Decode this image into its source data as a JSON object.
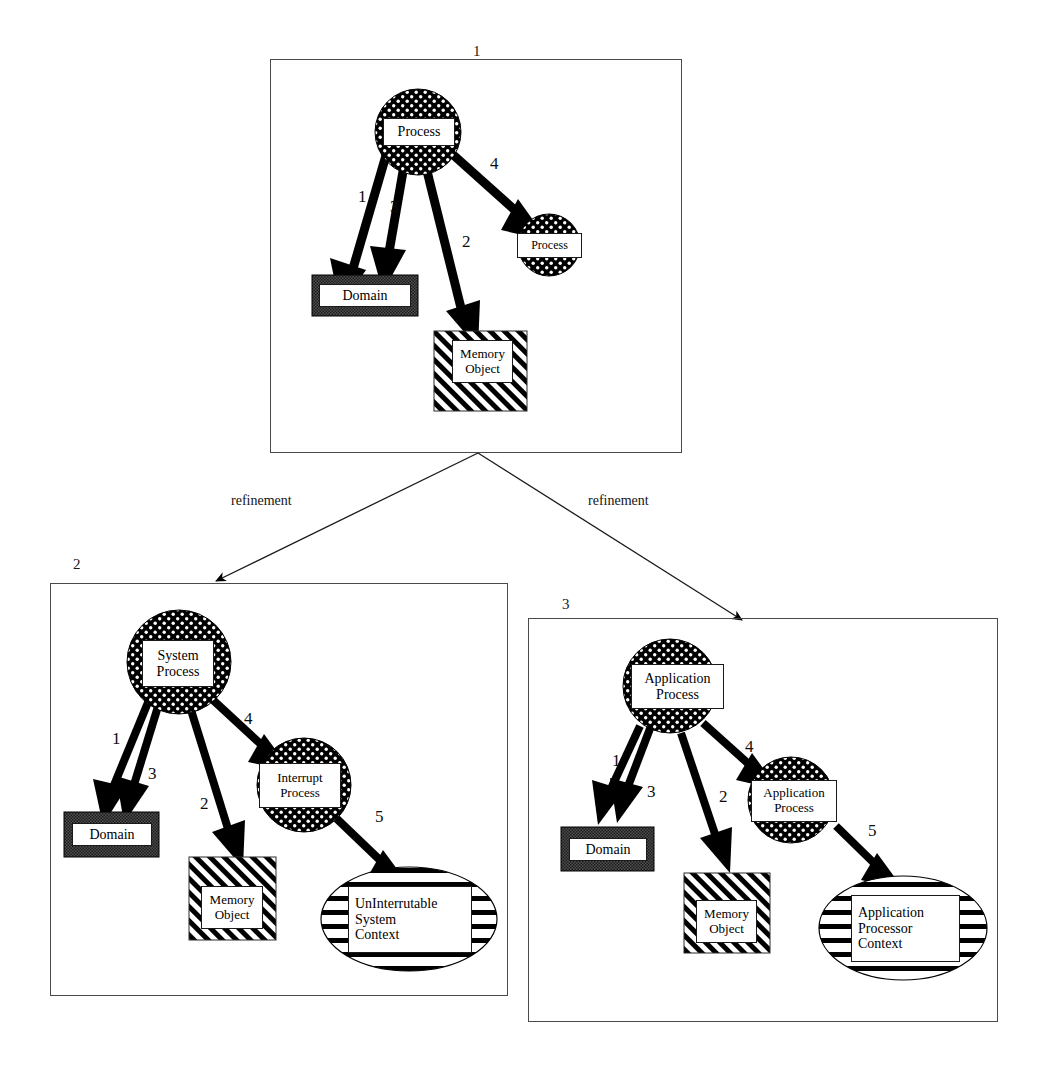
{
  "diagram": {
    "title_note": "Process refinement diagram",
    "panels": [
      {
        "id": "panel-1",
        "number": "1",
        "nodes": {
          "process_root": "Process",
          "domain": "Domain",
          "memory_object_l1": "Memory",
          "memory_object_l2": "Object",
          "process_child": "Process"
        },
        "edges": [
          "1",
          "3",
          "2",
          "4"
        ]
      },
      {
        "id": "panel-2",
        "number": "2",
        "nodes": {
          "system_process_l1": "System",
          "system_process_l2": "Process",
          "domain": "Domain",
          "memory_object_l1": "Memory",
          "memory_object_l2": "Object",
          "interrupt_process_l1": "Interrupt",
          "interrupt_process_l2": "Process",
          "context_l1": "UnInterrutable",
          "context_l2": "System",
          "context_l3": "Context"
        },
        "edges": [
          "1",
          "3",
          "2",
          "4",
          "5"
        ]
      },
      {
        "id": "panel-3",
        "number": "3",
        "nodes": {
          "application_process_l1": "Application",
          "application_process_l2": "Process",
          "domain": "Domain",
          "memory_object_l1": "Memory",
          "memory_object_l2": "Object",
          "application_process2_l1": "Application",
          "application_process2_l2": "Process",
          "context_l1": "Application",
          "context_l2": "Processor",
          "context_l3": "Context"
        },
        "edges": [
          "1",
          "3",
          "2",
          "4",
          "5"
        ]
      }
    ],
    "refinement_links": [
      {
        "label": "refinement",
        "from": "panel-1",
        "to": "panel-2"
      },
      {
        "label": "refinement",
        "from": "panel-1",
        "to": "panel-3"
      }
    ],
    "colors": {
      "ink": "#000000",
      "panel_border": "#4a4a4a",
      "domain_fill": "#555555",
      "paper": "#ffffff"
    }
  }
}
